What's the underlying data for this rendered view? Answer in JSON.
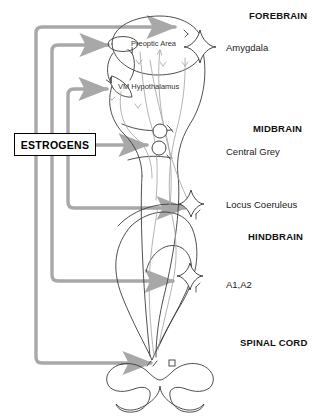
{
  "source_box": {
    "label": "ESTROGENS",
    "x": 14,
    "y": 133,
    "w": 82,
    "h": 23
  },
  "colors": {
    "outline": "#3b3b3b",
    "faint_outline": "#9a9a9a",
    "arrow_gray": "#a8a8a8",
    "text": "#111111",
    "background": "#ffffff"
  },
  "region_labels": [
    {
      "name": "forebrain",
      "text": "FOREBRAIN",
      "x": 249,
      "y": 10
    },
    {
      "name": "midbrain",
      "text": "MIDBRAIN",
      "x": 253,
      "y": 123
    },
    {
      "name": "hindbrain",
      "text": "HINDBRAIN",
      "x": 248,
      "y": 231
    },
    {
      "name": "spinal-cord",
      "text": "SPINAL CORD",
      "x": 240,
      "y": 337
    }
  ],
  "nucleus_labels": [
    {
      "name": "amygdala",
      "text": "Amygdala",
      "x": 226,
      "y": 42
    },
    {
      "name": "central-grey",
      "text": "Central Grey",
      "x": 226,
      "y": 146
    },
    {
      "name": "locus-coeruleus",
      "text": "Locus Coeruleus",
      "x": 226,
      "y": 199
    },
    {
      "name": "a1-a2",
      "text": "A1,A2",
      "x": 226,
      "y": 279
    }
  ],
  "inner_labels": [
    {
      "name": "preoptic-area",
      "text": "Preoptic Area",
      "x": 131,
      "y": 41
    },
    {
      "name": "vm-hypothalamus",
      "text": "VM Hypothalamus",
      "x": 118,
      "y": 84
    }
  ],
  "estrogen_arrows": [
    {
      "name": "arrow-to-amygdala",
      "target": "Amygdala",
      "trunk_x": 36,
      "turn_y": 27,
      "tip_x": 180
    },
    {
      "name": "arrow-to-preoptic-area",
      "target": "Preoptic Area",
      "trunk_x": 52,
      "turn_y": 45,
      "tip_x": 113
    },
    {
      "name": "arrow-to-vm-hypothalamus",
      "target": "VM Hypothalamus",
      "trunk_x": 68,
      "turn_y": 89,
      "tip_x": 112
    },
    {
      "name": "arrow-to-central-grey",
      "target": "Central Grey",
      "trunk_x": 96,
      "turn_y": 145,
      "tip_x": 152
    },
    {
      "name": "arrow-to-locus-coeruleus",
      "target": "Locus Coeruleus",
      "trunk_x": 68,
      "turn_y": 208,
      "tip_x": 190
    },
    {
      "name": "arrow-to-a1-a2",
      "target": "A1,A2",
      "trunk_x": 52,
      "turn_y": 281,
      "tip_x": 178
    },
    {
      "name": "arrow-to-spinal-cord",
      "target": "Spinal Cord",
      "trunk_x": 36,
      "turn_y": 363,
      "tip_x": 156
    }
  ],
  "nuclei_markers": [
    {
      "name": "amygdala-star",
      "shape": "concave-diamond",
      "cx": 200,
      "cy": 46,
      "r": 16
    },
    {
      "name": "locus-coeruleus-star",
      "shape": "concave-diamond",
      "cx": 191,
      "cy": 203,
      "r": 14
    },
    {
      "name": "a1a2-star",
      "shape": "concave-diamond",
      "cx": 190,
      "cy": 276,
      "r": 14
    },
    {
      "name": "central-grey-upper-circle",
      "shape": "circle",
      "cx": 160,
      "cy": 131,
      "r": 7
    },
    {
      "name": "central-grey-lower-circle",
      "shape": "circle",
      "cx": 159,
      "cy": 148,
      "r": 7
    }
  ]
}
